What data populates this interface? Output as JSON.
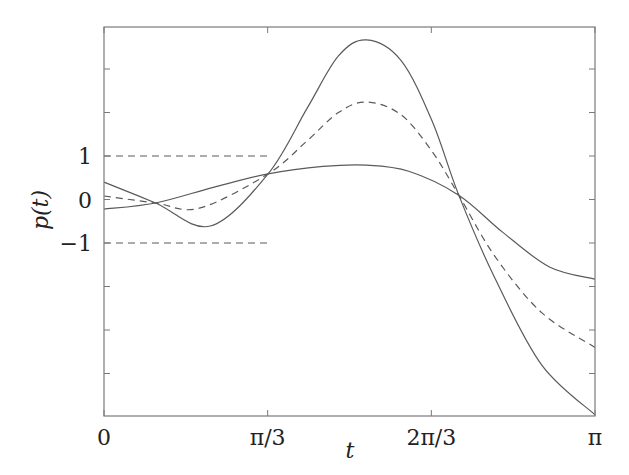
{
  "chart_data": {
    "type": "line",
    "title": "",
    "xlabel": "t",
    "ylabel": "p(t)",
    "xlim": [
      0,
      3.14159
    ],
    "ylim": [
      -5,
      3.95
    ],
    "grid": false,
    "legend": null,
    "x_ticks": [
      {
        "value": 0,
        "label": "0"
      },
      {
        "value": 1.0472,
        "label": "π/3"
      },
      {
        "value": 2.0944,
        "label": "2π/3"
      },
      {
        "value": 3.14159,
        "label": "π"
      }
    ],
    "y_ticks": [
      {
        "value": 1,
        "label": "1"
      },
      {
        "value": 0,
        "label": "0"
      },
      {
        "value": -1,
        "label": "−1"
      }
    ],
    "y_minor_ticks": [
      3,
      2,
      1,
      0,
      -1,
      -2,
      -3,
      -4
    ],
    "reference_lines": [
      {
        "y": 1,
        "x_range": [
          0,
          1.0472
        ],
        "style": "dashed"
      },
      {
        "y": -1,
        "x_range": [
          0,
          1.0472
        ],
        "style": "dashed"
      }
    ],
    "series": [
      {
        "name": "oscillating-solid",
        "style": "solid",
        "x": [
          0,
          0.33,
          0.68,
          1.05,
          1.3,
          1.5,
          1.68,
          1.9,
          2.1,
          2.27,
          2.5,
          2.8,
          3.14159
        ],
        "values": [
          0.4,
          -0.08,
          -0.61,
          0.59,
          2.1,
          3.3,
          3.67,
          3.2,
          1.8,
          0.1,
          -1.8,
          -3.8,
          -4.95
        ]
      },
      {
        "name": "dashed-mean",
        "style": "dashed",
        "x": [
          0,
          0.33,
          0.61,
          1.05,
          1.3,
          1.5,
          1.68,
          1.9,
          2.1,
          2.27,
          2.5,
          2.8,
          3.14159
        ],
        "values": [
          0.08,
          -0.08,
          -0.2,
          0.59,
          1.35,
          2.0,
          2.24,
          1.95,
          1.1,
          0.1,
          -1.3,
          -2.6,
          -3.4
        ]
      },
      {
        "name": "flat-solid",
        "style": "solid",
        "x": [
          0,
          0.33,
          0.7,
          1.05,
          1.4,
          1.68,
          1.95,
          2.27,
          2.55,
          2.85,
          3.14159
        ],
        "values": [
          -0.22,
          -0.08,
          0.28,
          0.59,
          0.76,
          0.79,
          0.65,
          0.1,
          -0.75,
          -1.55,
          -1.83
        ]
      }
    ]
  },
  "colors": {
    "axis": "#7a7a7a",
    "line": "#5a5a5a",
    "text": "#222222"
  }
}
